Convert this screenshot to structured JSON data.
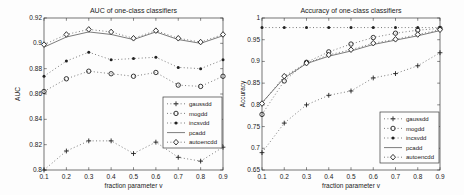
{
  "figure": {
    "background": "#fdfdfd",
    "axis_color": "#3a3a3a",
    "line_color": "#5a5a5a",
    "marker_color": "#222222",
    "text_color": "#222222"
  },
  "chart_data": [
    {
      "type": "line",
      "title": "AUC of one-class classifiers",
      "xlabel": "fraction parameter v",
      "ylabel": "AUC",
      "x": [
        0.1,
        0.2,
        0.3,
        0.4,
        0.5,
        0.6,
        0.7,
        0.8,
        0.9
      ],
      "xlim": [
        0.1,
        0.9
      ],
      "ylim": [
        0.8,
        0.92
      ],
      "xticks": [
        0.1,
        0.2,
        0.3,
        0.4,
        0.5,
        0.6,
        0.7,
        0.8,
        0.9
      ],
      "xtick_labels": [
        "0.1",
        "0.2",
        "0.3",
        "0.4",
        "0.5",
        "0.6",
        "0.7",
        "0.8",
        "0.9"
      ],
      "yticks": [
        0.8,
        0.82,
        0.84,
        0.86,
        0.88,
        0.9,
        0.92
      ],
      "ytick_labels": [
        "0.8",
        "0.82",
        "0.84",
        "0.86",
        "0.88",
        "0.9",
        "0.92"
      ],
      "grid": false,
      "legend_position": "middle-right",
      "series": [
        {
          "name": "gaussdd",
          "marker": "plus",
          "line": "dotted",
          "values": [
            0.8,
            0.815,
            0.823,
            0.823,
            0.813,
            0.822,
            0.81,
            0.807,
            0.818
          ]
        },
        {
          "name": "mogdd",
          "marker": "circle",
          "line": "dotted",
          "values": [
            0.862,
            0.872,
            0.878,
            0.876,
            0.874,
            0.877,
            0.867,
            0.866,
            0.874
          ]
        },
        {
          "name": "incsvdd",
          "marker": "dot",
          "line": "dotted",
          "values": [
            0.874,
            0.886,
            0.893,
            0.887,
            0.888,
            0.889,
            0.881,
            0.88,
            0.887
          ]
        },
        {
          "name": "pcadd",
          "marker": "none",
          "line": "solid",
          "values": [
            0.897,
            0.905,
            0.909,
            0.907,
            0.903,
            0.909,
            0.903,
            0.9,
            0.906
          ]
        },
        {
          "name": "autoencdd",
          "marker": "diamond",
          "line": "dotted",
          "values": [
            0.899,
            0.907,
            0.911,
            0.909,
            0.904,
            0.91,
            0.904,
            0.901,
            0.907
          ]
        }
      ]
    },
    {
      "type": "line",
      "title": "Accuracy of one-class classifiers",
      "xlabel": "fraction parameter v",
      "ylabel": "Accuracy",
      "x": [
        0.1,
        0.2,
        0.3,
        0.4,
        0.5,
        0.6,
        0.7,
        0.8,
        0.9
      ],
      "xlim": [
        0.1,
        0.9
      ],
      "ylim": [
        0.65,
        1.0
      ],
      "xticks": [
        0.1,
        0.2,
        0.3,
        0.4,
        0.5,
        0.6,
        0.7,
        0.8,
        0.9
      ],
      "xtick_labels": [
        "0.1",
        "0.2",
        "0.3",
        "0.4",
        "0.5",
        "0.6",
        "0.7",
        "0.8",
        "0.9"
      ],
      "yticks": [
        0.65,
        0.7,
        0.75,
        0.8,
        0.85,
        0.9,
        0.95,
        1.0
      ],
      "ytick_labels": [
        "0.65",
        "0.7",
        "0.75",
        "0.8",
        "0.85",
        "0.9",
        "0.95",
        "1"
      ],
      "grid": false,
      "legend_position": "bottom-right",
      "series": [
        {
          "name": "gaussdd",
          "marker": "plus",
          "line": "dotted",
          "values": [
            0.69,
            0.758,
            0.8,
            0.822,
            0.832,
            0.862,
            0.872,
            0.89,
            0.92
          ]
        },
        {
          "name": "mogdd",
          "marker": "circle",
          "line": "dotted",
          "values": [
            0.778,
            0.855,
            0.898,
            0.922,
            0.94,
            0.955,
            0.965,
            0.972,
            0.976
          ]
        },
        {
          "name": "incsvdd",
          "marker": "dot",
          "line": "dotted",
          "values": [
            0.978,
            0.978,
            0.978,
            0.978,
            0.978,
            0.978,
            0.978,
            0.978,
            0.978
          ]
        },
        {
          "name": "pcadd",
          "marker": "none",
          "line": "solid",
          "values": [
            0.805,
            0.862,
            0.895,
            0.912,
            0.924,
            0.939,
            0.949,
            0.959,
            0.971
          ]
        },
        {
          "name": "autoencdd",
          "marker": "diamond",
          "line": "dotted",
          "values": [
            0.803,
            0.866,
            0.896,
            0.915,
            0.927,
            0.942,
            0.951,
            0.962,
            0.973
          ]
        }
      ]
    }
  ]
}
